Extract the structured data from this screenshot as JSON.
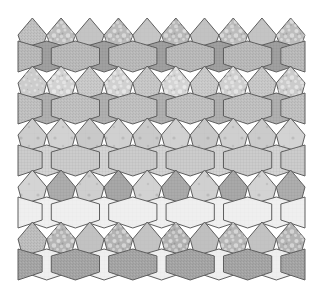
{
  "figure": {
    "background_color": "#ffffff",
    "width": 323,
    "height": 295,
    "stroke_color": "#5e5e5e",
    "stroke_width": 1
  },
  "palette": {
    "very_light": "#efefef",
    "light": "#d8d8d8",
    "light_mid": "#cfcfcf",
    "mid": "#c2c2c2",
    "mid_dark": "#b4b4b4",
    "dark": "#a6a6a6",
    "darker": "#9a9a9a",
    "darkest": "#8f8f8f"
  },
  "textures": {
    "names": [
      "plain",
      "fine-grain",
      "speckle-coarse",
      "speckle-fine",
      "crosshatch",
      "dots-sparse"
    ]
  },
  "geometry": {
    "left": 18,
    "right": 305,
    "columns": 5,
    "column_width": 57.4,
    "bands": [
      {
        "name": "band-1",
        "top": 22,
        "mid": 44,
        "bottom": 70,
        "cap_peak": 22,
        "cap_valley": 40
      },
      {
        "name": "band-2",
        "top": 70,
        "mid": 96,
        "bottom": 122,
        "cap_peak": 70,
        "cap_valley": 84
      },
      {
        "name": "band-3",
        "top": 122,
        "mid": 148,
        "bottom": 174,
        "cap_peak": 122,
        "cap_valley": 136
      },
      {
        "name": "band-4",
        "top": 174,
        "mid": 200,
        "bottom": 226,
        "cap_peak": 174,
        "cap_valley": 188
      },
      {
        "name": "band-5",
        "top": 226,
        "mid": 252,
        "bottom": 278,
        "cap_peak": 226,
        "cap_valley": 240
      }
    ]
  },
  "rows": [
    {
      "name": "row-1",
      "lens_fill": "#a0a0a0",
      "lens_texture": "crosshatch",
      "cap_fill": "#b8b8b8",
      "cap_texture": "fine-grain",
      "tiles": [
        {
          "fill": "#c0c0c0",
          "texture": "fine-grain"
        },
        {
          "fill": "#bdbdbd",
          "texture": "speckle-coarse"
        },
        {
          "fill": "#c4c4c4",
          "texture": "plain"
        },
        {
          "fill": "#bababa",
          "texture": "speckle-coarse"
        },
        {
          "fill": "#c6c6c6",
          "texture": "plain"
        },
        {
          "fill": "#b8b8b8",
          "texture": "speckle-coarse"
        },
        {
          "fill": "#c2c2c2",
          "texture": "plain"
        },
        {
          "fill": "#bcbcbc",
          "texture": "speckle-coarse"
        },
        {
          "fill": "#c4c4c4",
          "texture": "plain"
        },
        {
          "fill": "#bdbdbd",
          "texture": "speckle-coarse"
        },
        {
          "fill": "#c0c0c0",
          "texture": "plain"
        }
      ]
    },
    {
      "name": "row-2",
      "lens_fill": "#b0b0b0",
      "lens_texture": "crosshatch",
      "cap_fill": "#bfbfbf",
      "cap_texture": "fine-grain",
      "tiles": [
        {
          "fill": "#cccccc",
          "texture": "speckle-fine"
        },
        {
          "fill": "#d2d2d2",
          "texture": "speckle-coarse"
        },
        {
          "fill": "#c8c8c8",
          "texture": "fine-grain"
        },
        {
          "fill": "#d0d0d0",
          "texture": "speckle-coarse"
        },
        {
          "fill": "#c6c6c6",
          "texture": "fine-grain"
        },
        {
          "fill": "#d4d4d4",
          "texture": "speckle-coarse"
        },
        {
          "fill": "#c9c9c9",
          "texture": "fine-grain"
        },
        {
          "fill": "#cfcfcf",
          "texture": "speckle-coarse"
        },
        {
          "fill": "#c7c7c7",
          "texture": "fine-grain"
        },
        {
          "fill": "#cbcbcb",
          "texture": "speckle-coarse"
        },
        {
          "fill": "#c4c4c4",
          "texture": "speckle-fine"
        }
      ]
    },
    {
      "name": "row-3",
      "lens_fill": "#d4d4d4",
      "lens_texture": "crosshatch",
      "cap_fill": "#cccccc",
      "cap_texture": "crosshatch",
      "tiles": [
        {
          "fill": "#cdcdcd",
          "texture": "dots-sparse"
        },
        {
          "fill": "#d2d2d2",
          "texture": "dots-sparse"
        },
        {
          "fill": "#c9c9c9",
          "texture": "dots-sparse"
        },
        {
          "fill": "#d0d0d0",
          "texture": "dots-sparse"
        },
        {
          "fill": "#cacaca",
          "texture": "dots-sparse"
        },
        {
          "fill": "#d1d1d1",
          "texture": "dots-sparse"
        },
        {
          "fill": "#c8c8c8",
          "texture": "dots-sparse"
        },
        {
          "fill": "#cfcfcf",
          "texture": "dots-sparse"
        },
        {
          "fill": "#cbcbcb",
          "texture": "dots-sparse"
        },
        {
          "fill": "#d3d3d3",
          "texture": "dots-sparse"
        },
        {
          "fill": "#cdcdcd",
          "texture": "dots-sparse"
        }
      ]
    },
    {
      "name": "row-4",
      "lens_fill": "#f0f0f0",
      "lens_texture": "plain",
      "cap_fill": "#efefef",
      "cap_texture": "plain",
      "tiles": [
        {
          "fill": "#d4d4d4",
          "texture": "dots-sparse"
        },
        {
          "fill": "#adadad",
          "texture": "crosshatch"
        },
        {
          "fill": "#cfcfcf",
          "texture": "dots-sparse"
        },
        {
          "fill": "#a8a8a8",
          "texture": "crosshatch"
        },
        {
          "fill": "#d2d2d2",
          "texture": "dots-sparse"
        },
        {
          "fill": "#ababab",
          "texture": "crosshatch"
        },
        {
          "fill": "#d0d0d0",
          "texture": "dots-sparse"
        },
        {
          "fill": "#a9a9a9",
          "texture": "crosshatch"
        },
        {
          "fill": "#d3d3d3",
          "texture": "dots-sparse"
        },
        {
          "fill": "#aeaeae",
          "texture": "crosshatch"
        },
        {
          "fill": "#d5d5d5",
          "texture": "dots-sparse"
        }
      ]
    },
    {
      "name": "row-5",
      "lens_fill": "#efefef",
      "lens_texture": "plain",
      "cap_fill": "#a4a4a4",
      "cap_texture": "fine-grain",
      "tiles": [
        {
          "fill": "#bdbdbd",
          "texture": "fine-grain"
        },
        {
          "fill": "#b4b4b4",
          "texture": "speckle-coarse"
        },
        {
          "fill": "#c2c2c2",
          "texture": "plain"
        },
        {
          "fill": "#b2b2b2",
          "texture": "speckle-coarse"
        },
        {
          "fill": "#c4c4c4",
          "texture": "plain"
        },
        {
          "fill": "#b0b0b0",
          "texture": "speckle-coarse"
        },
        {
          "fill": "#c0c0c0",
          "texture": "plain"
        },
        {
          "fill": "#b6b6b6",
          "texture": "speckle-coarse"
        },
        {
          "fill": "#c3c3c3",
          "texture": "plain"
        },
        {
          "fill": "#b3b3b3",
          "texture": "speckle-coarse"
        },
        {
          "fill": "#bfbfbf",
          "texture": "plain"
        }
      ]
    }
  ]
}
